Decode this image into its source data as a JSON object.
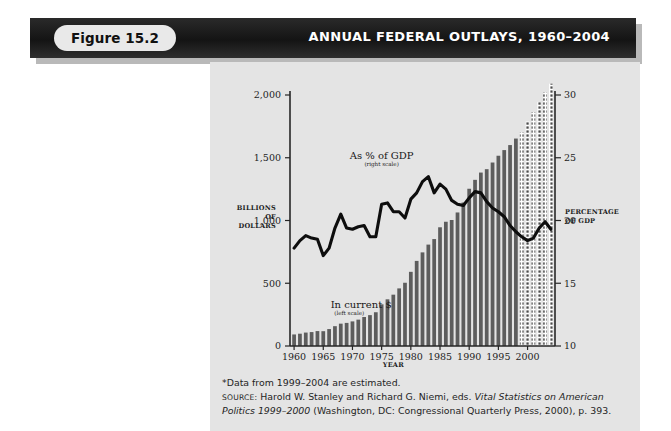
{
  "banner": {
    "figure_label": "Figure 15.2",
    "title": "ANNUAL FEDERAL OUTLAYS, 1960–2004"
  },
  "footnotes": {
    "estimated_note": "*Data from 1999–2004 are estimated.",
    "source_prefix": "SOURCE:",
    "source_authors": " Harold W. Stanley and Richard G. Niemi, eds. ",
    "source_title_italic": "Vital Statistics on American Politics 1999–2000",
    "source_rest": " (Washington, DC: Congressional Quarterly Press, 2000), p. 393."
  },
  "chart_data": {
    "type": "bar",
    "title": "ANNUAL FEDERAL OUTLAYS, 1960–2004",
    "xlabel": "YEAR",
    "ylabel": "BILLIONS OF DOLLARS",
    "y2label": "PERCENTAGE OF GDP",
    "ylabel_lines": [
      "BILLIONS",
      "OF",
      "DOLLARS"
    ],
    "y2label_lines": [
      "PERCENTAGE",
      "OF GDP"
    ],
    "grid": false,
    "ylim": [
      0,
      2000
    ],
    "y2lim": [
      10,
      30
    ],
    "xlim": [
      1959.3,
      2004.7
    ],
    "yticks": [
      0,
      500,
      1000,
      1500,
      2000
    ],
    "ytick_labels": [
      "0",
      "500",
      "1,000",
      "1,500",
      "2,000"
    ],
    "y2ticks": [
      10,
      15,
      20,
      25,
      30
    ],
    "y2tick_labels": [
      "10",
      "15",
      "20",
      "25",
      "30"
    ],
    "xticks": [
      1960,
      1965,
      1970,
      1975,
      1980,
      1985,
      1990,
      1995,
      2000
    ],
    "xtick_labels": [
      "1960",
      "1965",
      "1970",
      "1975",
      "1980",
      "1985",
      "1990",
      "1995",
      "2000"
    ],
    "annotations": [
      {
        "text": "As % of GDP",
        "sub": "(right scale)",
        "x": 1975.0,
        "y": 1490
      },
      {
        "text": "In current $",
        "sub": "(left scale)",
        "x": 1971.5,
        "y": 300
      }
    ],
    "estimated_from": 1999,
    "categories": [
      1960,
      1961,
      1962,
      1963,
      1964,
      1965,
      1966,
      1967,
      1968,
      1969,
      1970,
      1971,
      1972,
      1973,
      1974,
      1975,
      1976,
      1977,
      1978,
      1979,
      1980,
      1981,
      1982,
      1983,
      1984,
      1985,
      1986,
      1987,
      1988,
      1989,
      1990,
      1991,
      1992,
      1993,
      1994,
      1995,
      1996,
      1997,
      1998,
      1999,
      2000,
      2001,
      2002,
      2003,
      2004
    ],
    "series": [
      {
        "name": "In current $",
        "unit": "billions of dollars",
        "axis": "left",
        "style": "bar",
        "values": [
          92,
          98,
          107,
          111,
          119,
          118,
          135,
          158,
          178,
          184,
          196,
          210,
          231,
          246,
          269,
          332,
          372,
          409,
          459,
          504,
          591,
          678,
          746,
          808,
          852,
          946,
          990,
          1004,
          1064,
          1143,
          1253,
          1324,
          1382,
          1409,
          1462,
          1516,
          1561,
          1601,
          1653,
          1702,
          1789,
          1863,
          1945,
          2020,
          2090
        ]
      },
      {
        "name": "As % of GDP",
        "unit": "percent of GDP",
        "axis": "right",
        "style": "line",
        "values": [
          17.8,
          18.4,
          18.8,
          18.6,
          18.5,
          17.2,
          17.8,
          19.4,
          20.5,
          19.4,
          19.3,
          19.5,
          19.6,
          18.7,
          18.7,
          21.3,
          21.4,
          20.7,
          20.7,
          20.2,
          21.7,
          22.2,
          23.1,
          23.5,
          22.2,
          22.9,
          22.5,
          21.6,
          21.3,
          21.2,
          21.8,
          22.3,
          22.2,
          21.5,
          21.0,
          20.7,
          20.3,
          19.6,
          19.1,
          18.7,
          18.4,
          18.6,
          19.4,
          19.9,
          19.3
        ]
      }
    ]
  }
}
